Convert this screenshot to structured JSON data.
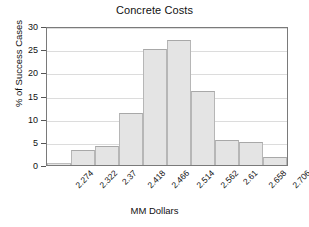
{
  "chart_data": {
    "type": "bar",
    "title": "Concrete Costs",
    "xlabel": "MM Dollars",
    "ylabel": "% of Success Cases",
    "categories": [
      "2.274",
      "2.322",
      "2.37",
      "2.418",
      "2.466",
      "2.514",
      "2.562",
      "2.61",
      "2.658",
      "2.706"
    ],
    "values": [
      0.5,
      3.3,
      4.0,
      11.3,
      25.0,
      27.0,
      16.0,
      5.5,
      4.9,
      1.8
    ],
    "yticks": [
      0,
      5,
      10,
      15,
      20,
      25,
      30
    ],
    "ylim": [
      0,
      30
    ],
    "grid": true,
    "legend": "none",
    "bar_style": "contiguous-histogram",
    "colors": {
      "bar_fill": "#e4e4e4",
      "bar_edge": "#b6b6b6",
      "grid": "#dcdcdc",
      "axis": "#7a7a7a",
      "text": "#111111",
      "background": "#ffffff"
    }
  }
}
